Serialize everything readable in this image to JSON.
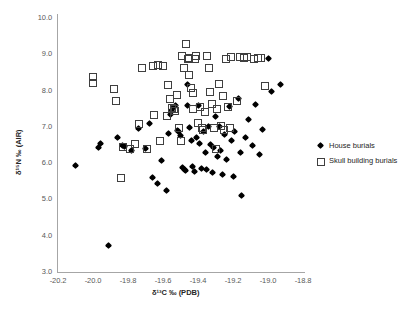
{
  "chart_data": {
    "type": "scatter",
    "title": "",
    "xlabel": "δ¹³C ‰ (PDB)",
    "ylabel": "δ¹⁵N ‰ (AIR)",
    "xlim": [
      -20.2,
      -18.8
    ],
    "ylim": [
      3.0,
      10.0
    ],
    "xticks": [
      "-20.2",
      "-20.0",
      "-19.8",
      "-19.6",
      "-19.4",
      "-19.2",
      "-19.0",
      "-18.8"
    ],
    "xtick_values": [
      -20.2,
      -20.0,
      -19.8,
      -19.6,
      -19.4,
      -19.2,
      -19.0,
      -18.8
    ],
    "yticks": [
      "3.0",
      "4.0",
      "5.0",
      "6.0",
      "7.0",
      "8.0",
      "9.0",
      "10.0"
    ],
    "ytick_values": [
      3.0,
      4.0,
      5.0,
      6.0,
      7.0,
      8.0,
      9.0,
      10.0
    ],
    "grid": false,
    "legend_position": "right",
    "series": [
      {
        "name": "House burials",
        "marker": "filled-diamond",
        "color": "#000000",
        "points": [
          [
            -20.1,
            5.93
          ],
          [
            -19.91,
            3.72
          ],
          [
            -19.97,
            6.42
          ],
          [
            -19.96,
            6.55
          ],
          [
            -19.86,
            6.72
          ],
          [
            -19.83,
            6.5
          ],
          [
            -19.82,
            6.45
          ],
          [
            -19.78,
            6.35
          ],
          [
            -19.74,
            6.95
          ],
          [
            -19.7,
            6.4
          ],
          [
            -19.68,
            7.1
          ],
          [
            -19.66,
            5.6
          ],
          [
            -19.63,
            5.45
          ],
          [
            -19.61,
            6.07
          ],
          [
            -19.58,
            5.25
          ],
          [
            -19.57,
            6.82
          ],
          [
            -19.56,
            7.35
          ],
          [
            -19.55,
            7.45
          ],
          [
            -19.54,
            7.52
          ],
          [
            -19.53,
            7.58
          ],
          [
            -19.52,
            6.9
          ],
          [
            -19.51,
            6.88
          ],
          [
            -19.5,
            6.75
          ],
          [
            -19.49,
            5.88
          ],
          [
            -19.48,
            5.82
          ],
          [
            -19.47,
            5.8
          ],
          [
            -19.46,
            8.18
          ],
          [
            -19.46,
            7.58
          ],
          [
            -19.45,
            6.98
          ],
          [
            -19.44,
            6.62
          ],
          [
            -19.43,
            5.9
          ],
          [
            -19.42,
            5.78
          ],
          [
            -19.41,
            6.7
          ],
          [
            -19.4,
            7.6
          ],
          [
            -19.39,
            6.55
          ],
          [
            -19.38,
            5.85
          ],
          [
            -19.37,
            6.88
          ],
          [
            -19.36,
            6.3
          ],
          [
            -19.35,
            5.83
          ],
          [
            -19.34,
            7.0
          ],
          [
            -19.33,
            6.52
          ],
          [
            -19.32,
            5.75
          ],
          [
            -19.31,
            6.44
          ],
          [
            -19.3,
            7.28
          ],
          [
            -19.29,
            6.18
          ],
          [
            -19.28,
            7.02
          ],
          [
            -19.27,
            6.35
          ],
          [
            -19.26,
            5.7
          ],
          [
            -19.25,
            6.8
          ],
          [
            -19.24,
            6.1
          ],
          [
            -19.22,
            7.55
          ],
          [
            -19.21,
            6.62
          ],
          [
            -19.2,
            5.62
          ],
          [
            -19.19,
            6.88
          ],
          [
            -19.17,
            7.78
          ],
          [
            -19.16,
            6.28
          ],
          [
            -19.15,
            5.1
          ],
          [
            -19.13,
            6.7
          ],
          [
            -19.11,
            7.2
          ],
          [
            -19.09,
            6.5
          ],
          [
            -19.07,
            7.62
          ],
          [
            -19.05,
            6.25
          ],
          [
            -19.03,
            6.92
          ],
          [
            -19.0,
            8.88
          ],
          [
            -18.98,
            7.98
          ],
          [
            -18.93,
            8.18
          ]
        ]
      },
      {
        "name": "Skull building burials",
        "marker": "open-square",
        "color": "#3f3f3f",
        "points": [
          [
            -20.0,
            8.38
          ],
          [
            -20.0,
            8.22
          ],
          [
            -19.88,
            8.05
          ],
          [
            -19.87,
            7.7
          ],
          [
            -19.84,
            5.6
          ],
          [
            -19.83,
            6.45
          ],
          [
            -19.79,
            6.38
          ],
          [
            -19.76,
            6.52
          ],
          [
            -19.74,
            7.08
          ],
          [
            -19.72,
            8.62
          ],
          [
            -19.69,
            6.4
          ],
          [
            -19.66,
            8.68
          ],
          [
            -19.65,
            7.32
          ],
          [
            -19.63,
            8.7
          ],
          [
            -19.62,
            6.62
          ],
          [
            -19.6,
            8.68
          ],
          [
            -19.58,
            7.3
          ],
          [
            -19.57,
            8.15
          ],
          [
            -19.56,
            7.78
          ],
          [
            -19.55,
            7.52
          ],
          [
            -19.54,
            7.48
          ],
          [
            -19.53,
            7.45
          ],
          [
            -19.52,
            7.88
          ],
          [
            -19.51,
            6.98
          ],
          [
            -19.5,
            6.62
          ],
          [
            -19.49,
            8.95
          ],
          [
            -19.48,
            8.62
          ],
          [
            -19.47,
            9.28
          ],
          [
            -19.46,
            8.88
          ],
          [
            -19.45,
            8.9
          ],
          [
            -19.45,
            8.42
          ],
          [
            -19.44,
            8.08
          ],
          [
            -19.43,
            7.92
          ],
          [
            -19.43,
            7.48
          ],
          [
            -19.42,
            8.88
          ],
          [
            -19.41,
            8.95
          ],
          [
            -19.4,
            7.12
          ],
          [
            -19.39,
            7.55
          ],
          [
            -19.38,
            6.98
          ],
          [
            -19.37,
            6.92
          ],
          [
            -19.36,
            7.42
          ],
          [
            -19.35,
            8.95
          ],
          [
            -19.34,
            8.62
          ],
          [
            -19.33,
            7.95
          ],
          [
            -19.32,
            7.62
          ],
          [
            -19.31,
            6.98
          ],
          [
            -19.3,
            6.4
          ],
          [
            -19.29,
            7.48
          ],
          [
            -19.28,
            8.18
          ],
          [
            -19.27,
            7.02
          ],
          [
            -19.26,
            7.85
          ],
          [
            -19.25,
            6.92
          ],
          [
            -19.24,
            8.88
          ],
          [
            -19.23,
            7.55
          ],
          [
            -19.22,
            6.98
          ],
          [
            -19.21,
            8.92
          ],
          [
            -19.18,
            7.72
          ],
          [
            -19.16,
            8.92
          ],
          [
            -19.14,
            8.9
          ],
          [
            -19.12,
            8.92
          ],
          [
            -19.08,
            8.88
          ],
          [
            -19.06,
            8.9
          ],
          [
            -19.04,
            8.9
          ],
          [
            -19.02,
            8.12
          ]
        ]
      }
    ]
  },
  "legend": {
    "items": [
      {
        "label": "House burials",
        "marker": "filled-diamond"
      },
      {
        "label": "Skull building burials",
        "marker": "open-square"
      }
    ]
  }
}
